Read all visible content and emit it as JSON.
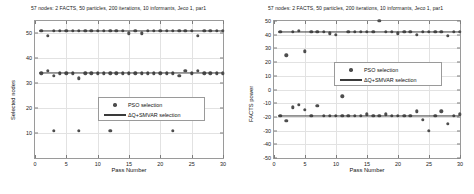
{
  "figure": {
    "title": "57 nodes: 2 FACTS, 50 particles, 200 iterations, 10 informants, Jeco 1, par1"
  },
  "legend": {
    "pso_label": "PSO selection",
    "dq_label": "ΔQ+SMVAR selection"
  },
  "colors": {
    "marker": "#4d4d4d",
    "line": "#3a3a3a",
    "grid": "#e2e2e2",
    "axis": "#9a9a9a"
  },
  "chart_data": [
    {
      "type": "scatter",
      "panel": "left",
      "title": "57 nodes: 2 FACTS, 50 particles, 200 iterations, 10 informants, Jeco 1, par1",
      "xlabel": "Pass Number",
      "ylabel": "Selected nodes",
      "xlim": [
        0,
        30
      ],
      "ylim": [
        0,
        55
      ],
      "xticks": [
        0,
        5,
        10,
        15,
        20,
        25,
        30
      ],
      "yticks": [
        10,
        20,
        30,
        40,
        50
      ],
      "grid": true,
      "legend_position": "center-right",
      "series": [
        {
          "name": "PSO selection",
          "marker": "circle",
          "x": [
            1,
            2,
            3,
            4,
            5,
            6,
            7,
            8,
            9,
            10,
            11,
            12,
            13,
            14,
            15,
            16,
            17,
            18,
            19,
            20,
            21,
            22,
            23,
            24,
            25,
            26,
            27,
            28,
            29,
            30,
            1,
            2,
            3,
            4,
            5,
            6,
            7,
            8,
            9,
            10,
            11,
            12,
            13,
            14,
            15,
            16,
            17,
            18,
            19,
            20,
            21,
            22,
            23,
            24,
            25,
            26,
            27,
            28,
            29,
            30,
            3,
            7,
            12,
            22
          ],
          "y": [
            51,
            49,
            51,
            51,
            51,
            51,
            51,
            51,
            51,
            51,
            51,
            51,
            51,
            51,
            50,
            51,
            50,
            51,
            51,
            51,
            51,
            51,
            51,
            51,
            51,
            49,
            51,
            51,
            51,
            51,
            34,
            35,
            33,
            34,
            34,
            34,
            32,
            34,
            34,
            34,
            34,
            34,
            34,
            34,
            34,
            34,
            34,
            34,
            34,
            34,
            34,
            34,
            33,
            35,
            34,
            35,
            34,
            34,
            34,
            34,
            11,
            11,
            11,
            11
          ]
        },
        {
          "name": "ΔQ+SMVAR selection",
          "marker": "line",
          "levels": [
            51,
            34
          ]
        }
      ]
    },
    {
      "type": "scatter",
      "panel": "right",
      "title": "57 nodes: 2 FACTS, 50 particles, 200 iterations, 10 informants, Jeco 1, par1",
      "xlabel": "Pass Number",
      "ylabel": "FACTS power",
      "xlim": [
        0,
        30
      ],
      "ylim": [
        -50,
        50
      ],
      "xticks": [
        0,
        5,
        10,
        15,
        20,
        25,
        30
      ],
      "yticks": [
        -50,
        -40,
        -30,
        -20,
        -10,
        0,
        10,
        20,
        30,
        40,
        50
      ],
      "grid": true,
      "legend_position": "upper-right",
      "series": [
        {
          "name": "PSO selection",
          "marker": "circle",
          "x": [
            1,
            2,
            3,
            4,
            5,
            6,
            7,
            8,
            9,
            10,
            11,
            12,
            13,
            14,
            15,
            16,
            17,
            18,
            19,
            20,
            21,
            22,
            23,
            24,
            25,
            26,
            27,
            28,
            29,
            30,
            1,
            2,
            3,
            4,
            5,
            6,
            7,
            8,
            9,
            10,
            11,
            12,
            13,
            14,
            15,
            16,
            17,
            18,
            19,
            20,
            21,
            22,
            23,
            24,
            25,
            26,
            27,
            28,
            29,
            30
          ],
          "y": [
            42,
            25,
            42,
            43,
            28,
            42,
            42,
            42,
            41,
            40,
            -5,
            42,
            42,
            42,
            42,
            42,
            50,
            42,
            42,
            41,
            42,
            42,
            40,
            42,
            42,
            42,
            42,
            39,
            42,
            42,
            -19,
            -23,
            -13,
            -11,
            -15,
            -19,
            -12,
            -19,
            -19,
            -19,
            -19,
            -19,
            -19,
            -19,
            -18,
            -19,
            -19,
            -18,
            -19,
            -19,
            -19,
            -19,
            -16,
            -22,
            -30,
            -19,
            -16,
            -25,
            -19,
            -18
          ]
        },
        {
          "name": "ΔQ+SMVAR selection",
          "marker": "line",
          "levels": [
            42,
            -19
          ]
        }
      ]
    }
  ]
}
